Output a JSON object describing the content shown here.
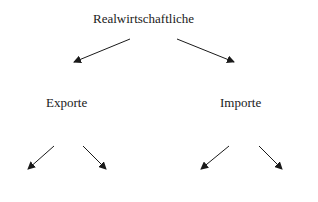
{
  "diagram": {
    "root": {
      "label": "Realwirtschaftliche"
    },
    "children": [
      {
        "label": "Exporte"
      },
      {
        "label": "Importe"
      }
    ],
    "arrow_color": "#1a1a1a"
  }
}
